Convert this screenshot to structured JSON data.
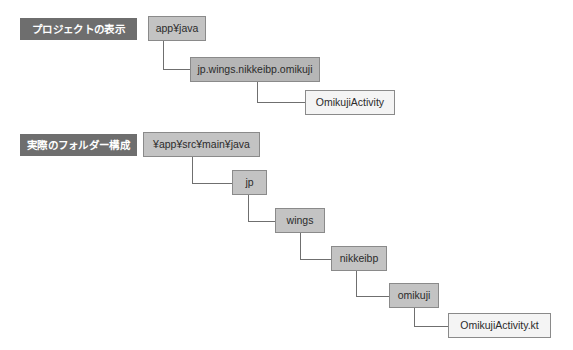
{
  "diagram": {
    "title_visible": false,
    "colors": {
      "label_bg": "#6e6e6e",
      "label_text": "#ffffff",
      "node_border": "#8a8a8a",
      "node_fill_gray": "#c3c3c3",
      "node_fill_gray_dark": "#b6b6b6",
      "node_fill_light": "#f4f4f4",
      "connector": "#6f6f6f",
      "background": "#ffffff"
    },
    "sections": [
      {
        "id": "project-view",
        "label": "プロジェクトの表示",
        "label_box": {
          "x": 20,
          "y": 18,
          "w": 117,
          "h": 22
        },
        "nodes": [
          {
            "id": "app-java",
            "text": "app¥java",
            "fill": "gray",
            "x": 148,
            "y": 16,
            "w": 58,
            "h": 25
          },
          {
            "id": "package-omikuji",
            "text": "jp.wings.nikkeibp.omikuji",
            "fill": "gray2",
            "x": 190,
            "y": 57,
            "w": 130,
            "h": 25
          },
          {
            "id": "omikuji-activity",
            "text": "OmikujiActivity",
            "fill": "light",
            "x": 305,
            "y": 90,
            "w": 90,
            "h": 25
          }
        ],
        "connectors": [
          {
            "from": "app-java",
            "to": "package-omikuji",
            "x": 163,
            "y_start": 41,
            "y_end": 69,
            "x_end": 190
          },
          {
            "from": "package-omikuji",
            "to": "omikuji-activity",
            "x": 257,
            "y_start": 82,
            "y_end": 102,
            "x_end": 305
          }
        ]
      },
      {
        "id": "folder-structure",
        "label": "実際のフォルダー構成",
        "label_box": {
          "x": 20,
          "y": 134,
          "w": 117,
          "h": 22
        },
        "nodes": [
          {
            "id": "root-java",
            "text": "¥app¥src¥main¥java",
            "fill": "gray",
            "x": 143,
            "y": 132,
            "w": 117,
            "h": 25
          },
          {
            "id": "jp",
            "text": "jp",
            "fill": "gray",
            "x": 232,
            "y": 170,
            "w": 35,
            "h": 25
          },
          {
            "id": "wings",
            "text": "wings",
            "fill": "gray",
            "x": 275,
            "y": 208,
            "w": 50,
            "h": 25
          },
          {
            "id": "nikkeibp",
            "text": "nikkeibp",
            "fill": "gray",
            "x": 331,
            "y": 246,
            "w": 56,
            "h": 25
          },
          {
            "id": "omikuji",
            "text": "omikuji",
            "fill": "gray",
            "x": 389,
            "y": 283,
            "w": 50,
            "h": 25
          },
          {
            "id": "omikuji-activity-kt",
            "text": "OmikujiActivity.kt",
            "fill": "light",
            "x": 448,
            "y": 313,
            "w": 103,
            "h": 25
          }
        ],
        "connectors": [
          {
            "from": "root-java",
            "to": "jp",
            "x": 192,
            "y_start": 157,
            "y_end": 183,
            "x_end": 232
          },
          {
            "from": "jp",
            "to": "wings",
            "x": 248,
            "y_start": 195,
            "y_end": 221,
            "x_end": 275
          },
          {
            "from": "wings",
            "to": "nikkeibp",
            "x": 300,
            "y_start": 233,
            "y_end": 259,
            "x_end": 331
          },
          {
            "from": "nikkeibp",
            "to": "omikuji",
            "x": 356,
            "y_start": 271,
            "y_end": 296,
            "x_end": 389
          },
          {
            "from": "omikuji",
            "to": "omikuji-activity-kt",
            "x": 414,
            "y_start": 308,
            "y_end": 326,
            "x_end": 448
          }
        ]
      }
    ]
  }
}
